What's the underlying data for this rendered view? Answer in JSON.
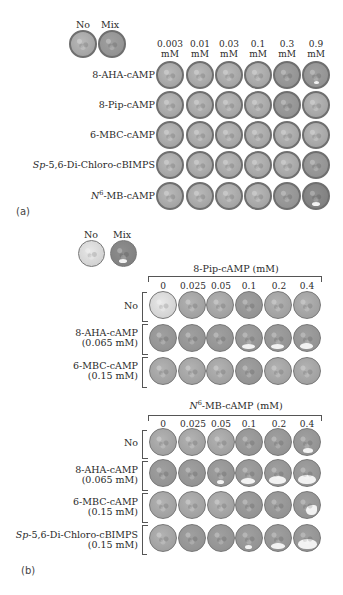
{
  "figure": {
    "panel_a": {
      "tag": "(a)",
      "controls": {
        "no_label": "No",
        "mix_label": "Mix"
      },
      "concentrations": [
        {
          "value": "0.003",
          "unit": "mM"
        },
        {
          "value": "0.01",
          "unit": "mM"
        },
        {
          "value": "0.03",
          "unit": "mM"
        },
        {
          "value": "0.1",
          "unit": "mM"
        },
        {
          "value": "0.3",
          "unit": "mM"
        },
        {
          "value": "0.9",
          "unit": "mM"
        }
      ],
      "rows": [
        {
          "label": "8-AHA-cAMP"
        },
        {
          "label": "8-Pip-cAMP"
        },
        {
          "label": "6-MBC-cAMP"
        },
        {
          "label_italic": "Sp",
          "label": "-5,6-Di-Chloro-cBIMPS"
        },
        {
          "label_italic": "N",
          "label_sup": "6",
          "label": "-MB-cAMP"
        }
      ]
    },
    "panel_b": {
      "tag": "(b)",
      "controls": {
        "no_label": "No",
        "mix_label": "Mix"
      },
      "block1": {
        "title": "8-Pip-cAMP (mM)",
        "concentrations": [
          "0",
          "0.025",
          "0.05",
          "0.1",
          "0.2",
          "0.4"
        ],
        "rows": [
          {
            "label": "No",
            "sub": ""
          },
          {
            "label": "8-AHA-cAMP",
            "sub": "(0.065 mM)"
          },
          {
            "label": "6-MBC-cAMP",
            "sub": "(0.15 mM)"
          }
        ]
      },
      "block2": {
        "title_italic": "N",
        "title_sup": "6",
        "title": "-MB-cAMP (mM)",
        "concentrations": [
          "0",
          "0.025",
          "0.05",
          "0.1",
          "0.2",
          "0.4"
        ],
        "rows": [
          {
            "label": "No",
            "sub": ""
          },
          {
            "label": "8-AHA-cAMP",
            "sub": "(0.065 mM)"
          },
          {
            "label": "6-MBC-cAMP",
            "sub": "(0.15 mM)"
          },
          {
            "label_italic": "Sp",
            "label": "-5,6-Di-Chloro-cBIMPS",
            "sub": "(0.15 mM)"
          }
        ]
      }
    }
  }
}
